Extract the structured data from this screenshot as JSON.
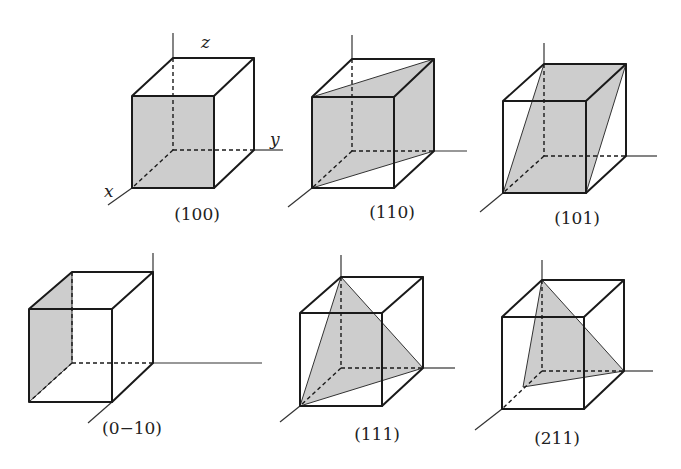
{
  "figure": {
    "axis_labels": {
      "x": "x",
      "y": "y",
      "z": "z"
    },
    "plane_color": "#c4c4c4",
    "panels": [
      {
        "label": "(100)",
        "shaded": "front face"
      },
      {
        "label": "(110)",
        "shaded": "diagonal plane through vertical edges"
      },
      {
        "label": "(101)",
        "shaded": "diagonal plane through horizontal edges"
      },
      {
        "label": "(0−10)",
        "shaded": "left face"
      },
      {
        "label": "(111)",
        "shaded": "triangle through three axis intercepts"
      },
      {
        "label": "(211)",
        "shaded": "triangle with x-intercept at 1/2"
      }
    ]
  }
}
